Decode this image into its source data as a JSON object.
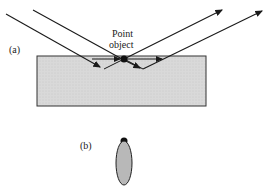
{
  "labels": {
    "part_a": "(a)",
    "part_b": "(b)",
    "point_object_line1": "Point",
    "point_object_line2": "object"
  },
  "colors": {
    "slab_fill": "#d6d6d6",
    "line": "#1a1a1a",
    "ellipse_fill": "#b5b5b5"
  }
}
